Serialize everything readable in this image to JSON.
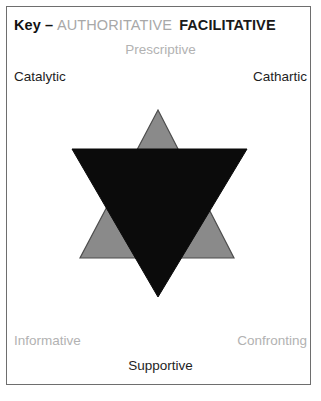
{
  "figure": {
    "frame_border_color": "#6e6e6e",
    "background_color": "#ffffff"
  },
  "key": {
    "label": "Key",
    "dash": "–",
    "authoritative": "AUTHORITATIVE",
    "facilitative": "FACILITATIVE",
    "authoritative_color": "#a8a8a8",
    "facilitative_color": "#1a1a1a"
  },
  "labels": {
    "prescriptive": "Prescriptive",
    "catalytic": "Catalytic",
    "cathartic": "Cathartic",
    "informative": "Informative",
    "confronting": "Confronting",
    "supportive": "Supportive"
  },
  "shapes": {
    "authoritative_triangle": {
      "name": "upward-triangle",
      "fill": "#8a8a8a",
      "stroke": "#4d4d4d",
      "points": "158,110 234,258 80,258"
    },
    "facilitative_triangle": {
      "name": "downward-triangle",
      "fill": "#0b0b0b",
      "stroke": "#0b0b0b",
      "points": "72,149 247,149 158,297"
    }
  }
}
